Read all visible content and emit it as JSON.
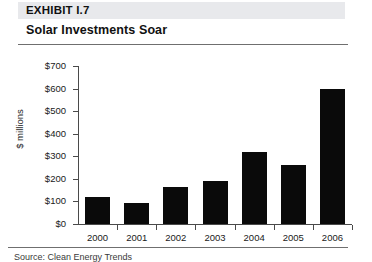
{
  "header": {
    "exhibit_label": "EXHIBIT I.7",
    "title": "Solar Investments Soar",
    "band_color": "#e8e9ec",
    "rule_color": "#6f6f6f"
  },
  "footer": {
    "source_note": "Source: Clean Energy Trends"
  },
  "chart_data": {
    "type": "bar",
    "title": "Solar Investments Soar",
    "xlabel": "",
    "ylabel": "$ millions",
    "categories": [
      "2000",
      "2001",
      "2002",
      "2003",
      "2004",
      "2005",
      "2006"
    ],
    "values": [
      120,
      95,
      165,
      190,
      320,
      260,
      600
    ],
    "ylim": [
      0,
      700
    ],
    "ytick_values": [
      0,
      100,
      200,
      300,
      400,
      500,
      600,
      700
    ],
    "ytick_labels": [
      "$0",
      "$100",
      "$200",
      "$300",
      "$400",
      "$500",
      "$600",
      "$700"
    ],
    "grid": false,
    "legend": false,
    "bar_color": "#0a0a0a",
    "axis_color": "#4a4a4a"
  }
}
